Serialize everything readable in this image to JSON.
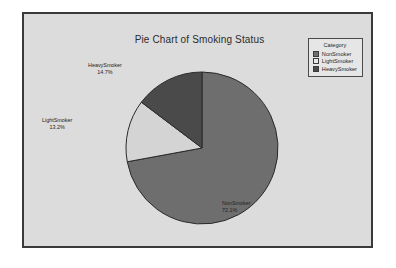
{
  "chart_data": {
    "type": "pie",
    "title": "Pie Chart of Smoking Status",
    "categories": [
      "NonSmoker",
      "LightSmoker",
      "HeavySmoker"
    ],
    "values": [
      72.1,
      13.2,
      14.7
    ],
    "value_unit": "%",
    "start_angle_deg": 0,
    "direction": "clockwise",
    "legend_position": "top-right",
    "grid": false,
    "xlabel": "",
    "ylabel": "",
    "slices": [
      {
        "label": "NonSmoker",
        "percent": "72.1%",
        "value": 72.1,
        "color": "#6e6e6e"
      },
      {
        "label": "LightSmoker",
        "percent": "13.2%",
        "value": 13.2,
        "color": "#d4d4d4"
      },
      {
        "label": "HeavySmoker",
        "percent": "14.7%",
        "value": 14.7,
        "color": "#4a4a4a"
      }
    ]
  },
  "title": "Pie Chart of Smoking Status",
  "legend": {
    "title": "Category",
    "items": [
      {
        "label": "NonSmoker",
        "color": "#6e6e6e"
      },
      {
        "label": "LightSmoker",
        "color": "#e8e8e8"
      },
      {
        "label": "HeavySmoker",
        "color": "#4a4a4a"
      }
    ]
  },
  "labels": {
    "nonsmoker": {
      "name": "NonSmoker",
      "percent": "72.1%"
    },
    "lightsmoker": {
      "name": "LightSmoker",
      "percent": "13.2%"
    },
    "heavysmoker": {
      "name": "HeavySmoker",
      "percent": "14.7%"
    }
  },
  "colors": {
    "plot_background": "#dcdcdc",
    "frame_border": "#3a3a3a",
    "page_background": "#ffffff",
    "slice_outline": "#2a2a2a"
  }
}
